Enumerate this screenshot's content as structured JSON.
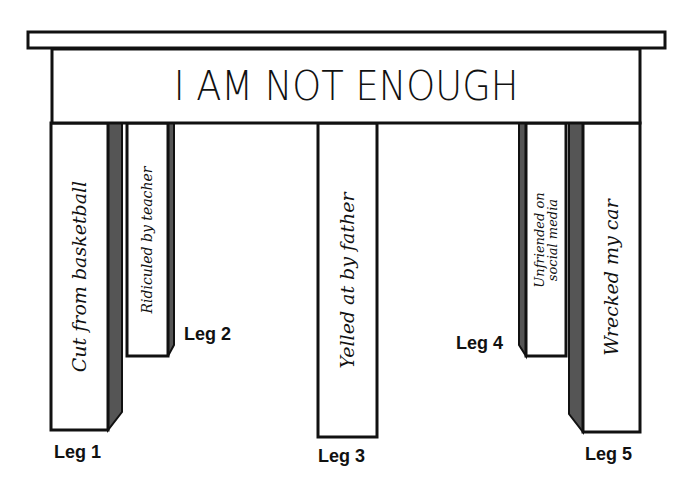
{
  "diagram": {
    "title": "I AM NOT ENOUGH",
    "legs": [
      {
        "id": "leg-1",
        "label": "Leg 1",
        "text": "Cut from basketball"
      },
      {
        "id": "leg-2",
        "label": "Leg 2",
        "text": "Ridiculed by teacher"
      },
      {
        "id": "leg-3",
        "label": "Leg 3",
        "text": "Yelled at by father"
      },
      {
        "id": "leg-4",
        "label": "Leg 4",
        "text_line1": "Unfriended on",
        "text_line2": "social media"
      },
      {
        "id": "leg-5",
        "label": "Leg 5",
        "text": "Wrecked my car"
      }
    ],
    "colors": {
      "outline": "#111111",
      "shade": "#555555",
      "fill": "#ffffff"
    }
  }
}
